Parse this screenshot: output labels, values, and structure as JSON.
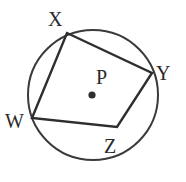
{
  "diagram": {
    "type": "inscribed-quadrilateral",
    "circle": {
      "cx": 93,
      "cy": 95,
      "r": 65,
      "stroke": "#3a3a3a"
    },
    "center": {
      "label": "P",
      "x": 92,
      "y": 95,
      "label_x": 96,
      "label_y": 84
    },
    "vertices": [
      {
        "label": "X",
        "x": 67,
        "y": 33,
        "label_x": 48,
        "label_y": 26
      },
      {
        "label": "Y",
        "x": 152,
        "y": 73,
        "label_x": 156,
        "label_y": 80
      },
      {
        "label": "Z",
        "x": 117,
        "y": 127,
        "label_x": 104,
        "label_y": 153
      },
      {
        "label": "W",
        "x": 32,
        "y": 118,
        "label_x": 5,
        "label_y": 128
      }
    ],
    "polygon_stroke": "#2e2e2e"
  }
}
